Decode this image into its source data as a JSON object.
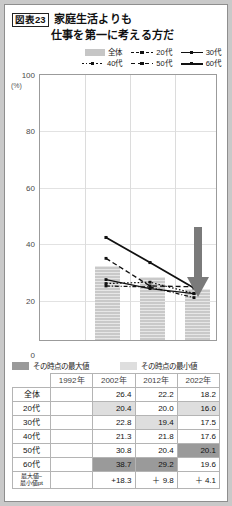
{
  "figure": {
    "tag": "図表23",
    "title_line1": "家庭生活よりも",
    "title_line2": "仕事を第一に考える方だ"
  },
  "legend": {
    "row1": [
      {
        "label": "全体",
        "style": "bar"
      },
      {
        "label": "20代",
        "style": "dashdot"
      },
      {
        "label": "30代",
        "style": "solid"
      }
    ],
    "row2": [
      {
        "label": "40代",
        "style": "dotted"
      },
      {
        "label": "50代",
        "style": "dash"
      },
      {
        "label": "60代",
        "style": "solid-thick"
      }
    ]
  },
  "sublegend": {
    "max_label": "その時点の最大値",
    "min_label": "その時点の最小値"
  },
  "axis": {
    "unit": "(%)",
    "y_ticks": [
      "100",
      "80",
      "60",
      "40",
      "20",
      "0"
    ],
    "y_min": 0,
    "y_max": 100
  },
  "table": {
    "columns": [
      "",
      "1992年",
      "2002年",
      "2012年",
      "2022年"
    ],
    "rows": [
      {
        "label": "全体",
        "values": [
          "",
          "26.4",
          "22.2",
          "18.2"
        ],
        "marks": [
          "",
          "",
          "",
          ""
        ]
      },
      {
        "label": "20代",
        "values": [
          "",
          "20.4",
          "20.0",
          "16.0"
        ],
        "marks": [
          "",
          "min",
          "",
          "min"
        ]
      },
      {
        "label": "30代",
        "values": [
          "",
          "22.8",
          "19.4",
          "17.5"
        ],
        "marks": [
          "",
          "",
          "min",
          ""
        ]
      },
      {
        "label": "40代",
        "values": [
          "",
          "21.3",
          "21.8",
          "17.6"
        ],
        "marks": [
          "",
          "",
          "",
          ""
        ]
      },
      {
        "label": "50代",
        "values": [
          "",
          "30.8",
          "20.4",
          "20.1"
        ],
        "marks": [
          "",
          "",
          "",
          "max"
        ]
      },
      {
        "label": "60代",
        "values": [
          "",
          "38.7",
          "29.2",
          "19.6"
        ],
        "marks": [
          "",
          "max",
          "max",
          ""
        ]
      },
      {
        "label": "最大値−\n最小値pt",
        "values": [
          "",
          "+18.3",
          "＋ 9.8",
          "＋ 4.1"
        ],
        "marks": [
          "",
          "",
          "",
          ""
        ]
      }
    ]
  },
  "chart_data": {
    "type": "line",
    "xlabel": "",
    "ylabel": "(%)",
    "ylim": [
      0,
      100
    ],
    "grid": true,
    "legend_position": "top-right",
    "categories": [
      "1992年",
      "2002年",
      "2012年",
      "2022年"
    ],
    "bars": {
      "name": "全体",
      "values": [
        null,
        26.4,
        22.2,
        18.2
      ],
      "color": "#c9c9c9"
    },
    "series": [
      {
        "name": "20代",
        "values": [
          null,
          20.4,
          20.0,
          16.0
        ],
        "style": "dashdot"
      },
      {
        "name": "30代",
        "values": [
          null,
          22.8,
          19.4,
          17.5
        ],
        "style": "solid"
      },
      {
        "name": "40代",
        "values": [
          null,
          21.3,
          21.8,
          17.6
        ],
        "style": "dotted"
      },
      {
        "name": "50代",
        "values": [
          null,
          30.8,
          20.4,
          20.1
        ],
        "style": "dash"
      },
      {
        "name": "60代",
        "values": [
          null,
          38.7,
          29.2,
          19.6
        ],
        "style": "solid-thick"
      }
    ],
    "annotations": [
      {
        "type": "arrow",
        "direction": "down",
        "color": "#7a7a7a",
        "x_category": "2022年"
      }
    ]
  },
  "colors": {
    "bar": "#c9c9c9",
    "max_cell": "#9a9a9a",
    "min_cell": "#dedede",
    "line": "#111111",
    "arrow": "#7a7a7a"
  }
}
